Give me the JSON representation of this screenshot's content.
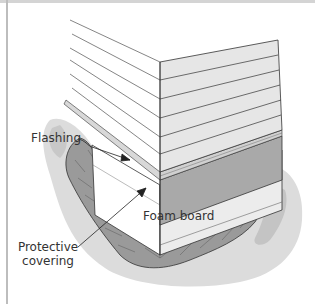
{
  "figure": {
    "labels": {
      "flashing": "Flashing",
      "foam_board": "Foam board",
      "protective_covering_line1": "Protective",
      "protective_covering_line2": "covering"
    },
    "colors": {
      "siding_face_right": "#e6e6e6",
      "siding_face_left": "#ffffff",
      "foam_band": "#a9a9a9",
      "ground_light": "#dcdcdc",
      "ground_mid": "#c4c4c4",
      "covering": "#9a9a9a",
      "line": "#333333",
      "frame": "#bdbdbd"
    }
  }
}
